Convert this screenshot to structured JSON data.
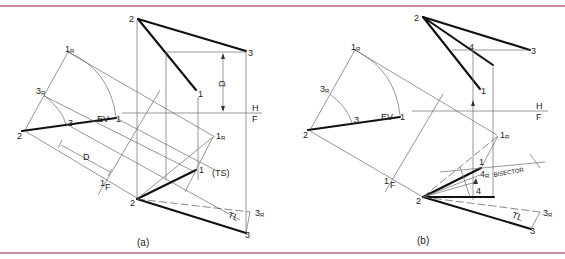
{
  "figure": {
    "rule_color": "#c8909c",
    "panels": [
      {
        "id": "a",
        "caption": "(a)",
        "labels": {
          "top_2": "2",
          "top_3": "3",
          "top_1": "1",
          "dim_D": "D",
          "fold_H": "H",
          "fold_F": "F",
          "aux_1R": "1",
          "aux_1R_sub": "R",
          "aux_3R": "3",
          "aux_3R_sub": "R",
          "aux_3": "3",
          "aux_EV": "EV",
          "aux_1": "1",
          "aux_2": "2",
          "dim_D2": "D",
          "fold_1": "1",
          "fold_F2": "F",
          "front_1R": "1",
          "front_1R_sub": "R",
          "front_1": "1",
          "front_TS": "(TS)",
          "front_2": "2",
          "front_TL": "TL",
          "front_3R": "3",
          "front_3R_sub": "R",
          "front_3": "3"
        }
      },
      {
        "id": "b",
        "caption": "(b)",
        "labels": {
          "top_2": "2",
          "top_4": "4",
          "top_3": "3",
          "top_1": "1",
          "fold_H": "H",
          "fold_F": "F",
          "aux_1R": "1",
          "aux_1R_sub": "R",
          "aux_3R": "3",
          "aux_3R_sub": "R",
          "aux_3": "3",
          "aux_EV": "EV",
          "aux_1": "1",
          "aux_2": "2",
          "fold_1": "1",
          "fold_F2": "F",
          "front_1R": "1",
          "front_1R_sub": "R",
          "front_1": "1",
          "front_4R": "4",
          "front_4R_sub": "R",
          "bisector": "BISECTOR",
          "front_4": "4",
          "front_2": "2",
          "front_TL": "TL",
          "front_3R": "3",
          "front_3R_sub": "R",
          "front_3": "3"
        }
      }
    ]
  }
}
